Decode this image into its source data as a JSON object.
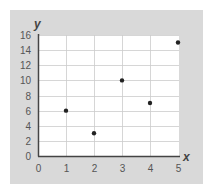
{
  "chart_data": {
    "type": "scatter",
    "title": "",
    "xlabel": "x",
    "ylabel": "y",
    "xlim": [
      0,
      5
    ],
    "ylim": [
      0,
      16
    ],
    "x_ticks": [
      "0",
      "1",
      "2",
      "3",
      "4",
      "5"
    ],
    "y_ticks": [
      "0",
      "2",
      "4",
      "6",
      "8",
      "10",
      "12",
      "14",
      "16"
    ],
    "grid": true,
    "legend": null,
    "series": [
      {
        "name": "points",
        "x": [
          1,
          2,
          3,
          4,
          5
        ],
        "y": [
          6,
          3,
          10,
          7,
          15
        ]
      }
    ],
    "colors": {
      "panel": "#d9d9d9",
      "plot_area": "#ffffff",
      "grid": "#cccccc",
      "axis": "#444444",
      "points": "#222222"
    }
  }
}
